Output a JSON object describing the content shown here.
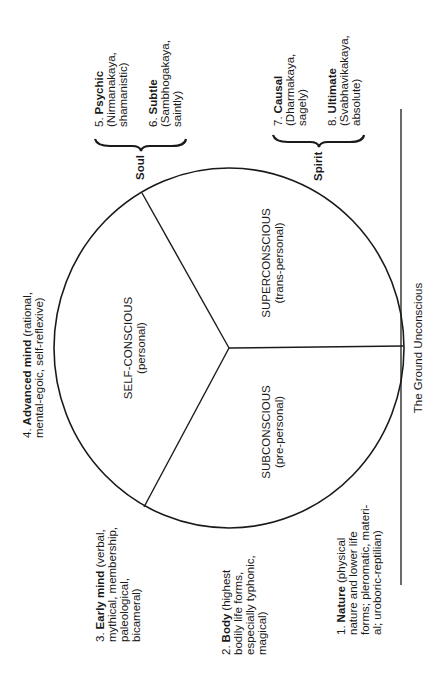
{
  "diagram": {
    "type": "circle-of-consciousness",
    "orientation": "rotated 90 degrees counter-clockwise",
    "ink_color": "#1a1a1a",
    "background": "#ffffff",
    "sectors": [
      {
        "title": "SELF-CONSCIOUS",
        "subtitle": "(personal)"
      },
      {
        "title": "SUBCONSCIOUS",
        "subtitle": "(pre-personal)"
      },
      {
        "title": "SUPERCONSCIOUS",
        "subtitle": "(trans-personal)"
      }
    ],
    "ground_label": "The Ground Unconscious",
    "groups": [
      {
        "label": "Soul"
      },
      {
        "label": "Spirit"
      }
    ],
    "levels": [
      {
        "number": "1.",
        "name": "Nature",
        "lines": [
          "(physical",
          "nature and lower life",
          "forms; pleromatic, materi-",
          "al; uroboric-reptilian)"
        ]
      },
      {
        "number": "2.",
        "name": "Body",
        "lines": [
          "(highest",
          "bodily life forms,",
          "especially typhonic,",
          "magical)"
        ]
      },
      {
        "number": "3.",
        "name": "Early mind",
        "lines": [
          "(verbal,",
          "mythical, membership,",
          "paleological,",
          "bicameral)"
        ]
      },
      {
        "number": "4.",
        "name": "Advanced mind",
        "lines": [
          "(rational,",
          "mental-egoic, self-reflexive)"
        ]
      },
      {
        "number": "5.",
        "name": "Psychic",
        "lines": [
          "",
          "(Nirmanakaya,",
          "shamanistic)"
        ]
      },
      {
        "number": "6.",
        "name": "Subtle",
        "lines": [
          "",
          "(Sambhogakaya,",
          "saintly)"
        ]
      },
      {
        "number": "7.",
        "name": "Causal",
        "lines": [
          "",
          "(Dharmakaya,",
          "sagely)"
        ]
      },
      {
        "number": "8.",
        "name": "Ultimate",
        "lines": [
          "",
          "(Svabhavikakaya,",
          "absolute)"
        ]
      }
    ]
  }
}
